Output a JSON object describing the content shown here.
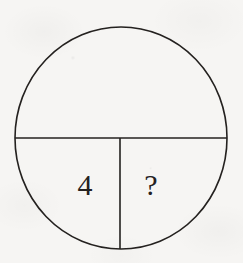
{
  "figure": {
    "kind": "circle-fraction-diagram",
    "background_color": "#f6f5f3",
    "ink_color": "#24211f",
    "circle": {
      "center_x": 121,
      "center_y": 138,
      "radius_x": 106,
      "radius_y": 111,
      "stroke_width": 1.6
    },
    "horizontal_divider": {
      "description": "horizontal diameter splitting circle into top half and bottom half",
      "x1": 15,
      "y1": 138,
      "x2": 227,
      "y2": 138,
      "stroke_width": 1.6
    },
    "vertical_divider": {
      "description": "vertical radius splitting the lower half into two quarters",
      "x1": 120,
      "y1": 138,
      "x2": 120,
      "y2": 249,
      "stroke_width": 1.6
    },
    "regions": [
      {
        "name": "top-half",
        "label": "",
        "description": "upper semicircle, unlabeled"
      },
      {
        "name": "bottom-left-quarter",
        "label": "4",
        "description": "lower-left quarter containing the numeral 4"
      },
      {
        "name": "bottom-right-quarter",
        "label": "?",
        "description": "lower-right quarter containing a question mark"
      }
    ],
    "labels": {
      "left_value": "4",
      "right_value": "?"
    }
  }
}
